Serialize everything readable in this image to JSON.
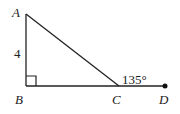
{
  "diagram": {
    "points": {
      "A": {
        "label": "A",
        "x": 26,
        "y": 14
      },
      "B": {
        "label": "B",
        "x": 26,
        "y": 86
      },
      "C": {
        "label": "C",
        "x": 119,
        "y": 86
      },
      "D": {
        "label": "D",
        "x": 165,
        "y": 86
      }
    },
    "side_label": "4",
    "angle_label": "135°",
    "right_angle_at": "B",
    "colors": {
      "stroke": "#222222",
      "background": "#ffffff"
    }
  }
}
